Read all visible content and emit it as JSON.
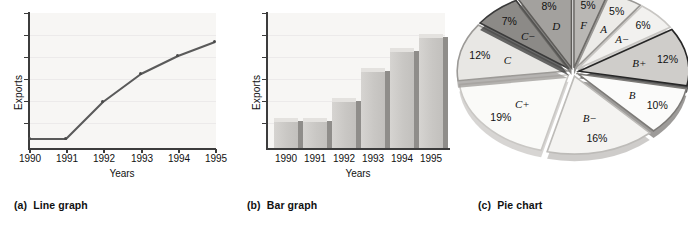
{
  "figure": {
    "panels": [
      {
        "tag": "(a)",
        "title": "Line graph"
      },
      {
        "tag": "(b)",
        "title": "Bar graph"
      },
      {
        "tag": "(c)",
        "title": "Pie chart"
      }
    ]
  },
  "chart_data": [
    {
      "type": "line",
      "title": "Line graph",
      "caption_tag": "(a)",
      "xlabel": "Years",
      "ylabel": "Exports",
      "categories": [
        "1990",
        "1991",
        "1992",
        "1993",
        "1994",
        "1995"
      ],
      "x": [
        1990,
        1991,
        1992,
        1993,
        1994,
        1995
      ],
      "values": [
        12,
        12,
        42,
        66,
        80,
        92
      ],
      "ylim": [
        0,
        100
      ],
      "yticks_count": 6,
      "y_tick_labels": [],
      "grid": true,
      "legend": "none",
      "line_color": "#5a5a5a",
      "marker": "square"
    },
    {
      "type": "bar",
      "title": "Bar graph",
      "caption_tag": "(b)",
      "xlabel": "Years",
      "ylabel": "Exports",
      "categories": [
        "1990",
        "1991",
        "1992",
        "1993",
        "1994",
        "1995"
      ],
      "values": [
        22,
        22,
        36,
        62,
        78,
        90
      ],
      "ylim": [
        0,
        100
      ],
      "yticks_count": 6,
      "y_tick_labels": [],
      "grid": true,
      "legend": "none",
      "bar_face_color": "#c9c7c4",
      "bar_top_color": "#e4e2df",
      "bar_side_color": "#8f8d8a"
    },
    {
      "type": "pie",
      "title": "Pie chart",
      "caption_tag": "(c)",
      "exploded": true,
      "legend": "none",
      "labels": [
        "F",
        "A",
        "A−",
        "B+",
        "B",
        "B−",
        "C+",
        "C",
        "C−",
        "D"
      ],
      "values": [
        5,
        5,
        6,
        12,
        10,
        16,
        19,
        12,
        7,
        8
      ],
      "pct_labels": [
        "5%",
        "5%",
        "6%",
        "12%",
        "10%",
        "16%",
        "19%",
        "12%",
        "7%",
        "8%"
      ],
      "slice_colors": [
        "#b9b7b4",
        "#ecebe8",
        "#f2f1ef",
        "#cfcdca",
        "#fbfbfa",
        "#f4f3f1",
        "#fafaf8",
        "#e8e7e4",
        "#8c8a87",
        "#a3a19e"
      ],
      "slice_edge_colors": [
        "#6e6c69",
        "#9a9895",
        "#c8c6c3",
        "#262626",
        "#7c7a77",
        "#bdbbb8",
        "#c9c7c4",
        "#9c9a97",
        "#3a3a3a",
        "#5e5c59"
      ]
    }
  ]
}
